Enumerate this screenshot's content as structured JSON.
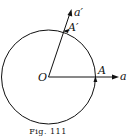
{
  "figure": {
    "caption": "Fig. 111",
    "labels": {
      "origin": "O",
      "point_a": "A",
      "point_a_prime": "A′",
      "ray_a": "a",
      "ray_a_prime": "a′"
    },
    "stroke_color": "#111111"
  }
}
